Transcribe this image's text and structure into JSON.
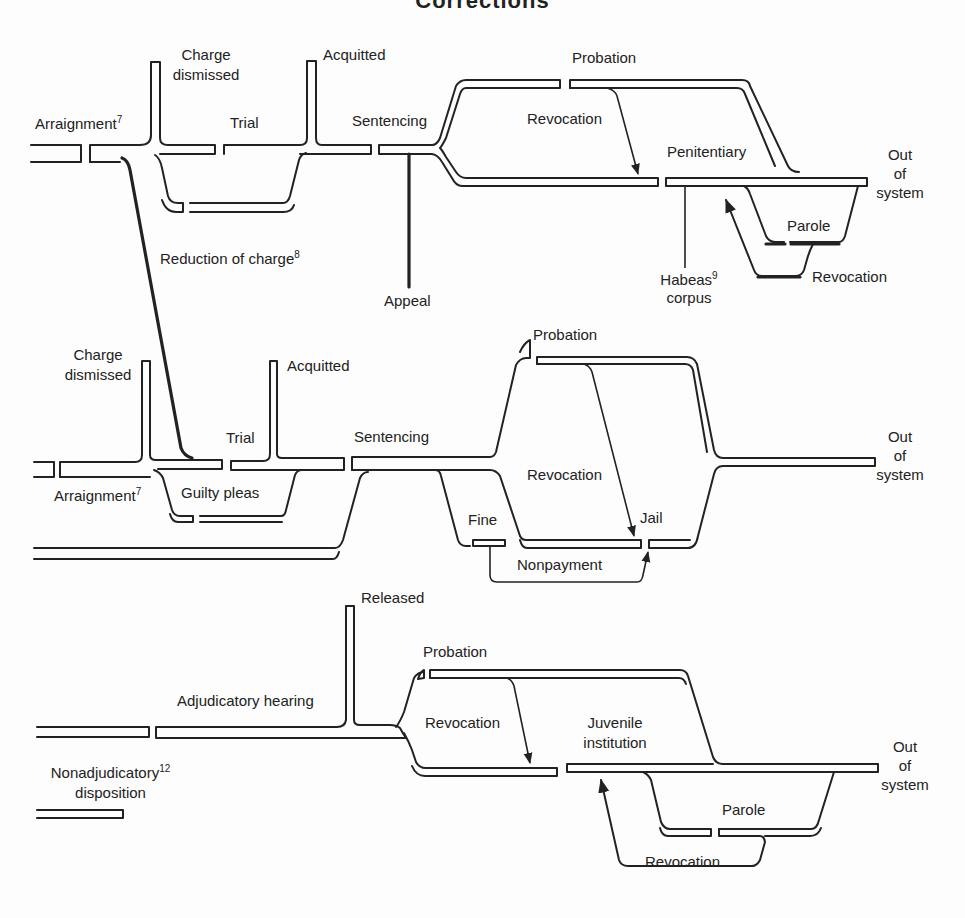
{
  "title": "Corrections",
  "adult_felony": {
    "arraignment": "Arraignment",
    "arraignment_note": "7",
    "charge_dismissed": "Charge dismissed",
    "trial": "Trial",
    "acquitted": "Acquitted",
    "sentencing": "Sentencing",
    "reduction_of_charge": "Reduction of charge",
    "reduction_note": "8",
    "appeal": "Appeal",
    "probation": "Probation",
    "revocation": "Revocation",
    "penitentiary": "Penitentiary",
    "habeas": "Habeas",
    "habeas_note": "9",
    "corpus": "corpus",
    "parole": "Parole",
    "parole_revocation": "Revocation",
    "out": [
      "Out",
      "of",
      "system"
    ]
  },
  "adult_misdemeanor": {
    "charge_dismissed": "Charge dismissed",
    "arraignment": "Arraignment",
    "arraignment_note": "7",
    "trial": "Trial",
    "acquitted": "Acquitted",
    "guilty_pleas": "Guilty pleas",
    "sentencing": "Sentencing",
    "probation": "Probation",
    "revocation": "Revocation",
    "fine": "Fine",
    "jail": "Jail",
    "nonpayment": "Nonpayment",
    "out": [
      "Out",
      "of",
      "system"
    ]
  },
  "juvenile": {
    "released": "Released",
    "adjudicatory_hearing": "Adjudicatory hearing",
    "nonadjudicatory": "Nonadjudicatory",
    "nonadjudicatory_note": "12",
    "disposition": "disposition",
    "probation": "Probation",
    "revocation": "Revocation",
    "juvenile_institution": [
      "Juvenile",
      "institution"
    ],
    "parole": "Parole",
    "parole_revocation": "Revocation",
    "out": [
      "Out",
      "of",
      "system"
    ]
  }
}
